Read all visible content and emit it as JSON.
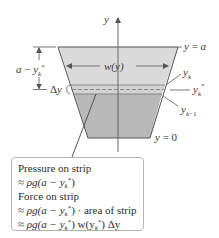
{
  "figure": {
    "type": "hydrostatic-force-diagram",
    "colors": {
      "upper_region": "#dadada",
      "lower_region": "#b9b9b9",
      "strip": "#d0d0d0",
      "outline": "#555555",
      "axis": "#666666",
      "text": "#3a3a3a"
    },
    "axis_label": "y",
    "labels": {
      "top_level": "y = a",
      "bottom_level": "y = 0",
      "width": "w(y)",
      "depth": "a − y",
      "depth_sub": "k",
      "depth_sup": "*",
      "delta_y": "Δy",
      "y_k": "y",
      "y_k_sub": "k",
      "y_k_star": "y",
      "y_k_star_sub": "k",
      "y_k_star_sup": "*",
      "y_k_minus_1": "y",
      "y_k_minus_1_sub": "k−1"
    }
  },
  "callout": {
    "line1": "Pressure on strip",
    "line2_prefix": "≈ ",
    "line2_expr": "ρg(a − y",
    "line3": "Force on strip",
    "line4_expr": "ρg(a − y",
    "line4_suffix": ") · area of strip",
    "line5_expr": "ρg(a − y",
    "line5_mid": ") w(y",
    "line5_end": ") Δy",
    "sub_k": "k",
    "star": "*",
    "approx": "≈ "
  }
}
